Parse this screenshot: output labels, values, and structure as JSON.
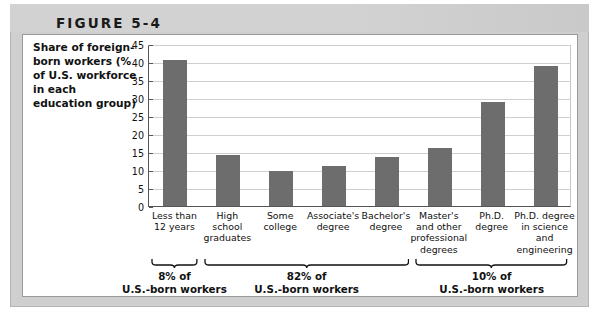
{
  "figure": {
    "header_label": "FIGURE 5-4",
    "y_axis_caption": "Share of foreign-born workers (% of U.S. workforce in each education group)"
  },
  "colors": {
    "bar": "#6d6d6d",
    "header_band": "#d2d2d2",
    "frame": "#cfcfcf",
    "gridline": "#cfcfcf",
    "axis": "#555555",
    "text": "#111111",
    "card_background": "#ffffff"
  },
  "chart_data": {
    "type": "bar",
    "title": "FIGURE 5-4",
    "ylabel": "Share of foreign-born workers (% of U.S. workforce in each education group)",
    "xlabel": "",
    "ylim": [
      0,
      45
    ],
    "yticks": [
      0,
      5,
      10,
      15,
      20,
      25,
      30,
      35,
      40,
      45
    ],
    "ytick_labels": [
      "0",
      "5",
      "10",
      "15",
      "20",
      "25",
      "30",
      "35",
      "40",
      "45"
    ],
    "grid": true,
    "legend": "none",
    "categories": [
      "Less than 12 years",
      "High school graduates",
      "Some college",
      "Associate's degree",
      "Bachelor's degree",
      "Master's and other professional degrees",
      "Ph.D. degree",
      "Ph.D. degree in science and engineering"
    ],
    "category_lines": [
      [
        "Less than",
        "12 years"
      ],
      [
        "High",
        "school",
        "graduates"
      ],
      [
        "Some",
        "college"
      ],
      [
        "Associate's",
        "degree"
      ],
      [
        "Bachelor's",
        "degree"
      ],
      [
        "Master's",
        "and other",
        "professional",
        "degrees"
      ],
      [
        "Ph.D.",
        "degree"
      ],
      [
        "Ph.D. degree",
        "in science",
        "and",
        "engineering"
      ]
    ],
    "values": [
      40.5,
      14.2,
      9.7,
      11.0,
      13.6,
      16.2,
      28.8,
      38.8
    ],
    "annotations": [
      {
        "label_lines": [
          "8% of",
          "U.S.-born workers"
        ],
        "spans_categories": [
          "Less than 12 years"
        ]
      },
      {
        "label_lines": [
          "82% of",
          "U.S.-born workers"
        ],
        "spans_categories": [
          "High school graduates",
          "Some college",
          "Associate's degree",
          "Bachelor's degree"
        ]
      },
      {
        "label_lines": [
          "10% of",
          "U.S.-born workers"
        ],
        "spans_categories": [
          "Master's and other professional degrees",
          "Ph.D. degree",
          "Ph.D. degree in science and engineering"
        ]
      }
    ]
  }
}
